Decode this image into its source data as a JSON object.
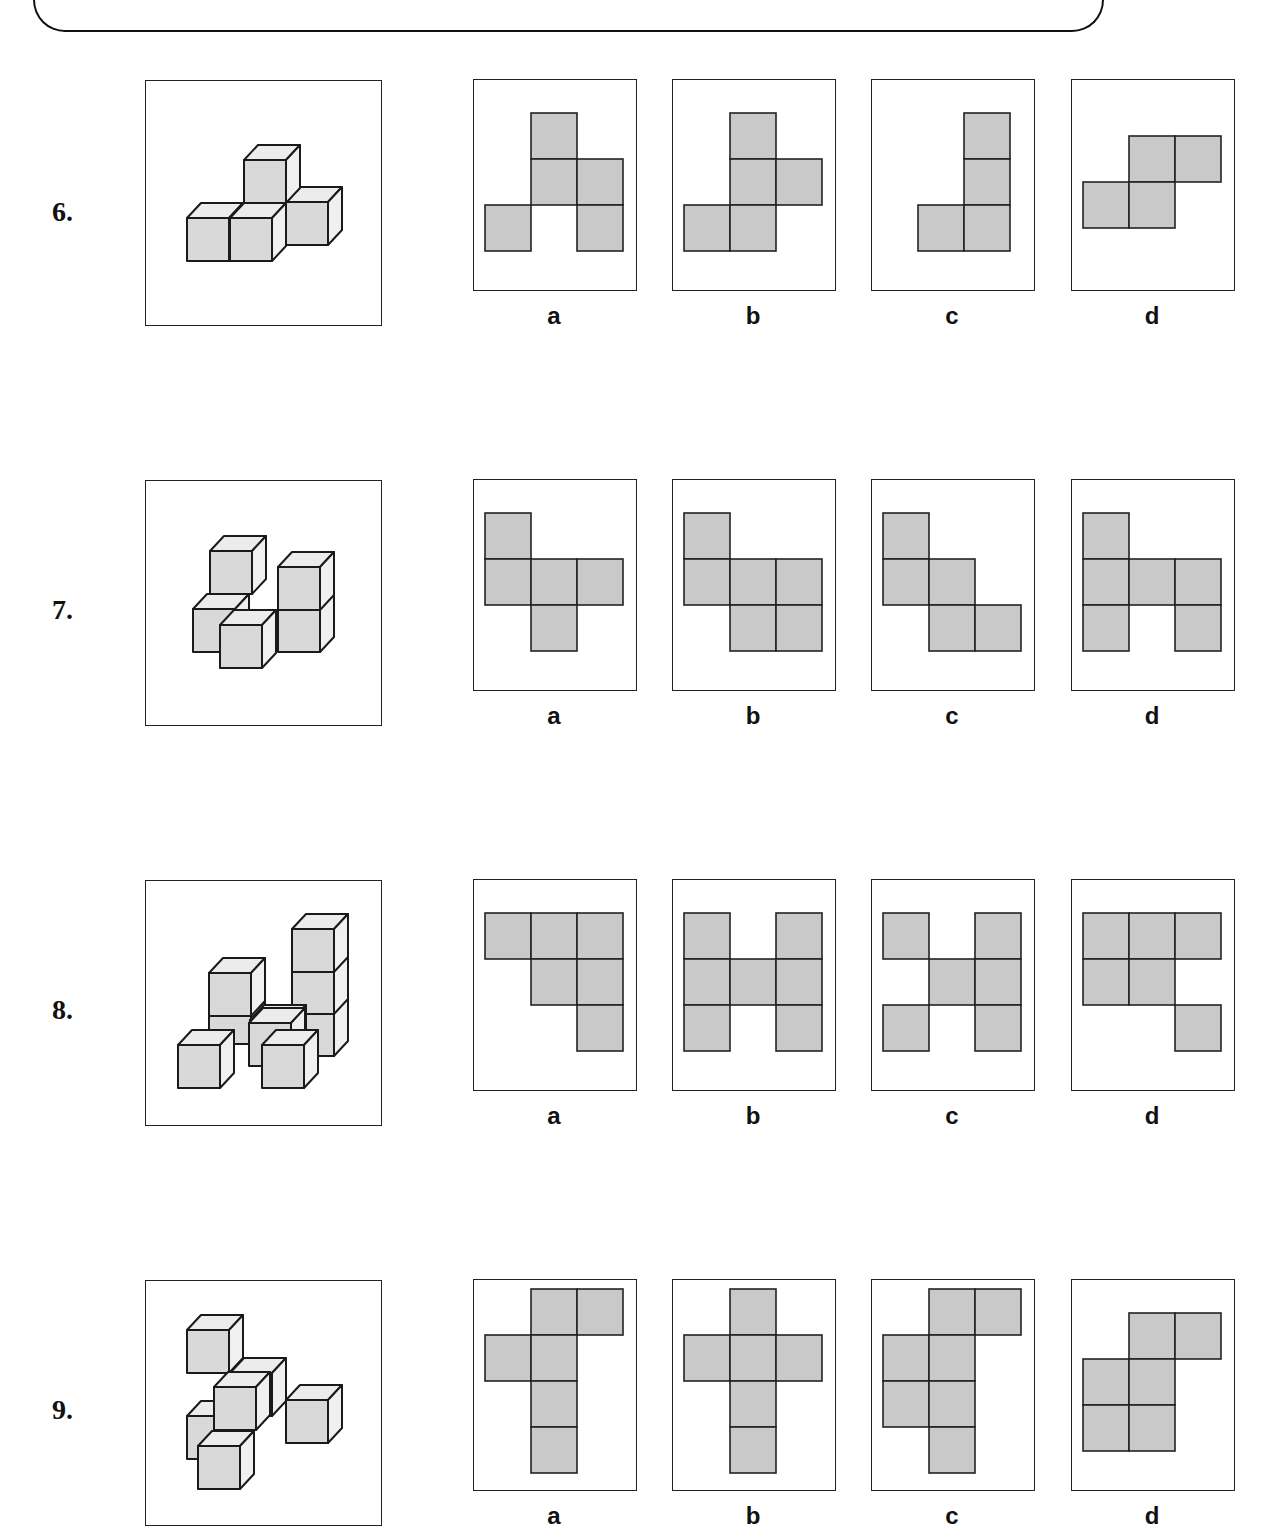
{
  "header": {
    "visible": "bottom edge of rounded instruction box (text cut off)"
  },
  "layout": {
    "cell_size": 46,
    "option_columns_x": [
      473,
      672,
      871,
      1071
    ],
    "cube": {
      "w": 42,
      "h": 43,
      "dx": 14,
      "dy": -15
    }
  },
  "colors": {
    "net_fill": "#c9c9c9",
    "cube_front": "#d9d9d9",
    "cube_top": "#ececec",
    "line": "#1a1a1a"
  },
  "questions": [
    {
      "number": "6.",
      "row_top": 80,
      "number_y": 196,
      "figure": {
        "cubes": [
          [
            286,
            202
          ],
          [
            244,
            160
          ],
          [
            187,
            218
          ],
          [
            230,
            218
          ]
        ]
      },
      "options": [
        {
          "label": "a",
          "cells": [
            [
              1,
              0
            ],
            [
              1,
              1
            ],
            [
              2,
              1
            ],
            [
              0,
              2
            ],
            [
              2,
              2
            ]
          ],
          "origin_y": 113
        },
        {
          "label": "b",
          "cells": [
            [
              1,
              0
            ],
            [
              1,
              1
            ],
            [
              2,
              1
            ],
            [
              0,
              2
            ],
            [
              1,
              2
            ]
          ],
          "origin_y": 113
        },
        {
          "label": "c",
          "cells": [
            [
              1,
              0
            ],
            [
              1,
              1
            ],
            [
              0,
              2
            ],
            [
              1,
              2
            ]
          ],
          "origin_y": 113,
          "origin_dx": 35
        },
        {
          "label": "d",
          "cells": [
            [
              1,
              0
            ],
            [
              2,
              0
            ],
            [
              0,
              1
            ],
            [
              1,
              1
            ]
          ],
          "origin_y": 136
        }
      ]
    },
    {
      "number": "7.",
      "row_top": 480,
      "number_y": 594,
      "figure": {
        "cubes": [
          [
            210,
            551
          ],
          [
            193,
            609
          ],
          [
            278,
            609
          ],
          [
            278,
            567
          ],
          [
            220,
            625
          ]
        ]
      },
      "options": [
        {
          "label": "a",
          "cells": [
            [
              0,
              0
            ],
            [
              0,
              1
            ],
            [
              1,
              1
            ],
            [
              2,
              1
            ],
            [
              1,
              2
            ]
          ],
          "origin_y": 513
        },
        {
          "label": "b",
          "cells": [
            [
              0,
              0
            ],
            [
              0,
              1
            ],
            [
              1,
              1
            ],
            [
              2,
              1
            ],
            [
              1,
              2
            ],
            [
              2,
              2
            ]
          ],
          "origin_y": 513
        },
        {
          "label": "c",
          "cells": [
            [
              0,
              0
            ],
            [
              0,
              1
            ],
            [
              1,
              1
            ],
            [
              1,
              2
            ],
            [
              2,
              2
            ]
          ],
          "origin_y": 513
        },
        {
          "label": "d",
          "cells": [
            [
              0,
              0
            ],
            [
              0,
              1
            ],
            [
              1,
              1
            ],
            [
              2,
              1
            ],
            [
              0,
              2
            ],
            [
              2,
              2
            ]
          ],
          "origin_y": 513
        }
      ]
    },
    {
      "number": "8.",
      "row_top": 880,
      "number_y": 994,
      "figure": {
        "cubes": [
          [
            292,
            1013
          ],
          [
            292,
            971
          ],
          [
            292,
            929
          ],
          [
            209,
            1001
          ],
          [
            250,
            1020
          ],
          [
            209,
            973
          ],
          [
            249,
            1023
          ],
          [
            178,
            1045
          ],
          [
            262,
            1045
          ]
        ]
      },
      "options": [
        {
          "label": "a",
          "cells": [
            [
              0,
              0
            ],
            [
              1,
              0
            ],
            [
              2,
              0
            ],
            [
              1,
              1
            ],
            [
              2,
              1
            ],
            [
              2,
              2
            ]
          ],
          "origin_y": 913
        },
        {
          "label": "b",
          "cells": [
            [
              0,
              0
            ],
            [
              2,
              0
            ],
            [
              0,
              1
            ],
            [
              1,
              1
            ],
            [
              2,
              1
            ],
            [
              0,
              2
            ],
            [
              2,
              2
            ]
          ],
          "origin_y": 913
        },
        {
          "label": "c",
          "cells": [
            [
              0,
              0
            ],
            [
              2,
              0
            ],
            [
              1,
              1
            ],
            [
              2,
              1
            ],
            [
              0,
              2
            ],
            [
              2,
              2
            ]
          ],
          "origin_y": 913
        },
        {
          "label": "d",
          "cells": [
            [
              0,
              0
            ],
            [
              1,
              0
            ],
            [
              2,
              0
            ],
            [
              0,
              1
            ],
            [
              1,
              1
            ],
            [
              2,
              2
            ]
          ],
          "origin_y": 913
        }
      ]
    },
    {
      "number": "9.",
      "row_top": 1280,
      "number_y": 1394,
      "figure": {
        "cubes": [
          [
            187,
            1330
          ],
          [
            230,
            1373
          ],
          [
            187,
            1416
          ],
          [
            286,
            1400
          ],
          [
            214,
            1387
          ],
          [
            198,
            1446
          ]
        ]
      },
      "options": [
        {
          "label": "a",
          "cells": [
            [
              1,
              0
            ],
            [
              2,
              0
            ],
            [
              0,
              1
            ],
            [
              1,
              1
            ],
            [
              1,
              2
            ],
            [
              1,
              3
            ]
          ],
          "origin_y": 1289
        },
        {
          "label": "b",
          "cells": [
            [
              1,
              0
            ],
            [
              0,
              1
            ],
            [
              1,
              1
            ],
            [
              2,
              1
            ],
            [
              1,
              2
            ],
            [
              1,
              3
            ]
          ],
          "origin_y": 1289
        },
        {
          "label": "c",
          "cells": [
            [
              1,
              0
            ],
            [
              2,
              0
            ],
            [
              0,
              1
            ],
            [
              1,
              1
            ],
            [
              0,
              2
            ],
            [
              1,
              2
            ],
            [
              1,
              3
            ]
          ],
          "origin_y": 1289
        },
        {
          "label": "d",
          "cells": [
            [
              1,
              0
            ],
            [
              2,
              0
            ],
            [
              0,
              1
            ],
            [
              1,
              1
            ],
            [
              0,
              2
            ],
            [
              1,
              2
            ]
          ],
          "origin_y": 1313
        }
      ]
    }
  ]
}
